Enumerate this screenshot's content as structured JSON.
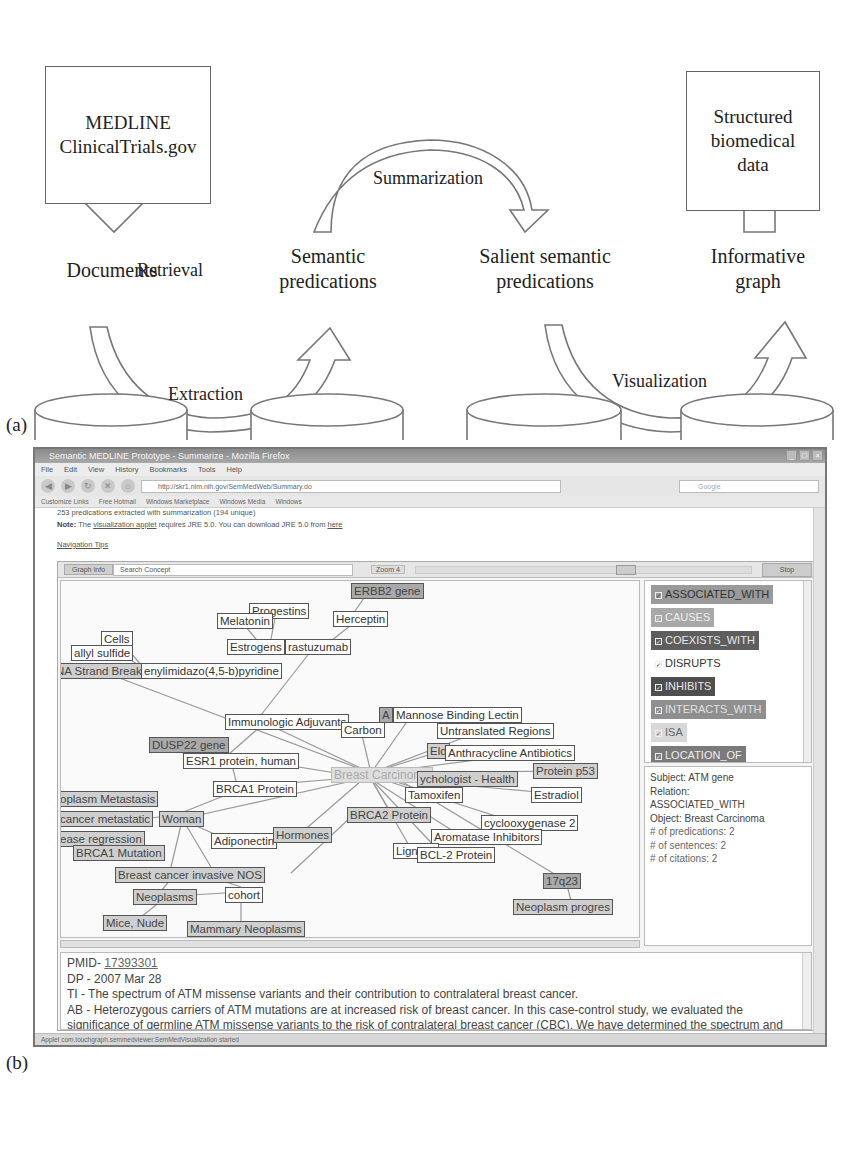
{
  "panel_a": {
    "letter": "(a)",
    "source_box": "MEDLINE\nClinicalTrials.gov",
    "output_box": "Structured\nbiomedical\ndata",
    "cylinders": [
      "Documents",
      "Semantic\npredications",
      "Salient semantic\npredications",
      "Informative\ngraph"
    ],
    "arrows": {
      "retrieval": "Retrieval",
      "extraction": "Extraction",
      "summarization": "Summarization",
      "visualization": "Visualization"
    }
  },
  "panel_b": {
    "letter": "(b)",
    "window": {
      "title": "Semantic MEDLINE Prototype - Summarize - Mozilla Firefox",
      "menu": [
        "File",
        "Edit",
        "View",
        "History",
        "Bookmarks",
        "Tools",
        "Help"
      ],
      "url": "http://skr1.nlm.nih.gov/SemMedWeb/Summary.do",
      "search_placeholder": "Google",
      "bookmarks": [
        "Customize Links",
        "Free Hotmail",
        "Windows Marketplace",
        "Windows Media",
        "Windows"
      ]
    },
    "page": {
      "predications_line": "253 predications extracted with summarization (194 unique)",
      "note_label": "Note:",
      "note_pre": "The",
      "note_link": "visualization applet",
      "note_mid": "requires JRE 5.0. You can download JRE 5.0 from",
      "note_here": "here",
      "nav_tips": "Navigation Tips"
    },
    "applet": {
      "tab_graph_info": "Graph Info",
      "search_concept": "Search Concept",
      "zoom_label": "Zoom 4",
      "stop_button": "Stop",
      "nodes": [
        {
          "label": "ERBB2 gene",
          "x": 290,
          "y": 2,
          "style": "dark"
        },
        {
          "label": "Progestins",
          "x": 188,
          "y": 22,
          "style": "plain"
        },
        {
          "label": "Melatonin",
          "x": 156,
          "y": 32,
          "style": "plain"
        },
        {
          "label": "Herceptin",
          "x": 272,
          "y": 30,
          "style": "plain"
        },
        {
          "label": "Estrogens",
          "x": 166,
          "y": 58,
          "style": "plain"
        },
        {
          "label": "rastuzumab",
          "x": 224,
          "y": 58,
          "style": "plain"
        },
        {
          "label": "Cells",
          "x": 40,
          "y": 50,
          "style": "plain"
        },
        {
          "label": "allyl sulfide",
          "x": 10,
          "y": 64,
          "style": "plain"
        },
        {
          "label": "NA Strand Break",
          "x": -8,
          "y": 82,
          "style": "mid"
        },
        {
          "label": "enylimidazo(4,5-b)pyridine",
          "x": 80,
          "y": 82,
          "style": "plain"
        },
        {
          "label": "Immunologic Adjuvants",
          "x": 164,
          "y": 133,
          "style": "plain"
        },
        {
          "label": "Carbon",
          "x": 280,
          "y": 141,
          "style": "plain"
        },
        {
          "label": "A",
          "x": 318,
          "y": 126,
          "style": "dark"
        },
        {
          "label": "Mannose Binding Lectin",
          "x": 332,
          "y": 126,
          "style": "plain"
        },
        {
          "label": "Untranslated Regions",
          "x": 376,
          "y": 142,
          "style": "plain"
        },
        {
          "label": "DUSP22 gene",
          "x": 88,
          "y": 156,
          "style": "dark"
        },
        {
          "label": "ESR1 protein, human",
          "x": 122,
          "y": 172,
          "style": "plain"
        },
        {
          "label": "Eld",
          "x": 366,
          "y": 162,
          "style": "mid"
        },
        {
          "label": "Anthracycline Antibiotics",
          "x": 384,
          "y": 164,
          "style": "plain"
        },
        {
          "label": "Breast Carcinoma",
          "x": 270,
          "y": 186,
          "style": "center"
        },
        {
          "label": "Protein p53",
          "x": 472,
          "y": 182,
          "style": "mid"
        },
        {
          "label": "ychologist - Health",
          "x": 356,
          "y": 190,
          "style": "mid"
        },
        {
          "label": "BRCA1 Protein",
          "x": 152,
          "y": 200,
          "style": "plain"
        },
        {
          "label": "oplasm Metastasis",
          "x": -4,
          "y": 210,
          "style": "mid"
        },
        {
          "label": "Tamoxifen",
          "x": 344,
          "y": 206,
          "style": "plain"
        },
        {
          "label": "Estradiol",
          "x": 470,
          "y": 206,
          "style": "plain"
        },
        {
          "label": "cancer metastatic",
          "x": -4,
          "y": 230,
          "style": "mid"
        },
        {
          "label": "Woman",
          "x": 98,
          "y": 230,
          "style": "mid"
        },
        {
          "label": "BRCA2 Protein",
          "x": 286,
          "y": 226,
          "style": "mid"
        },
        {
          "label": "cyclooxygenase 2",
          "x": 420,
          "y": 234,
          "style": "plain"
        },
        {
          "label": "ease regression",
          "x": -4,
          "y": 250,
          "style": "mid"
        },
        {
          "label": "Adiponectin",
          "x": 150,
          "y": 252,
          "style": "plain"
        },
        {
          "label": "Hormones",
          "x": 212,
          "y": 246,
          "style": "mid"
        },
        {
          "label": "Aromatase Inhibitors",
          "x": 370,
          "y": 248,
          "style": "plain"
        },
        {
          "label": "Lignans",
          "x": 332,
          "y": 262,
          "style": "plain"
        },
        {
          "label": "BCL-2 Protein",
          "x": 356,
          "y": 266,
          "style": "plain"
        },
        {
          "label": "BRCA1 Mutation",
          "x": 12,
          "y": 264,
          "style": "mid"
        },
        {
          "label": "Breast cancer invasive NOS",
          "x": 54,
          "y": 286,
          "style": "mid"
        },
        {
          "label": "17q23",
          "x": 482,
          "y": 292,
          "style": "dark"
        },
        {
          "label": "Neoplasms",
          "x": 72,
          "y": 308,
          "style": "mid"
        },
        {
          "label": "cohort",
          "x": 164,
          "y": 306,
          "style": "plain"
        },
        {
          "label": "Neoplasm progres",
          "x": 452,
          "y": 318,
          "style": "mid"
        },
        {
          "label": "Mice, Nude",
          "x": 42,
          "y": 334,
          "style": "mid"
        },
        {
          "label": "Mammary Neoplasms",
          "x": 126,
          "y": 340,
          "style": "mid"
        }
      ],
      "relations": [
        {
          "label": "ASSOCIATED_WITH",
          "bg": "#9a9a9a",
          "fg": "#333333"
        },
        {
          "label": "CAUSES",
          "bg": "#a8a8a8",
          "fg": "#eeeeee"
        },
        {
          "label": "COEXISTS_WITH",
          "bg": "#5e5e5e",
          "fg": "#e8e8e8"
        },
        {
          "label": "DISRUPTS",
          "bg": "#ffffff",
          "fg": "#333333"
        },
        {
          "label": "INHIBITS",
          "bg": "#4f4f4f",
          "fg": "#e8e8e8"
        },
        {
          "label": "INTERACTS_WITH",
          "bg": "#8f8f8f",
          "fg": "#e0e0e0"
        },
        {
          "label": "ISA",
          "bg": "#d8d8d8",
          "fg": "#666666"
        },
        {
          "label": "LOCATION_OF",
          "bg": "#7a7a7a",
          "fg": "#eeeeee"
        },
        {
          "label": "PART_OF",
          "bg": "#8e8e8e",
          "fg": "#eeeeee"
        }
      ],
      "info": {
        "subject": "Subject: ATM gene",
        "relation_label": "Relation:",
        "relation_value": "ASSOCIATED_WITH",
        "object": "Object: Breast Carcinoma",
        "predications": "# of predications: 2",
        "sentences": "# of sentences: 2",
        "citations": "# of citations: 2"
      },
      "abstract": {
        "pmid_label": "PMID- ",
        "pmid_value": "17393301",
        "dp": "DP - 2007 Mar 28",
        "ti": "TI - The spectrum of ATM missense variants and their contribution to contralateral breast cancer.",
        "ab": "AB - Heterozygous carriers of ATM mutations are at increased risk of breast cancer. In this case-control study, we evaluated the significance of germline ATM missense variants to the risk of contralateral breast cancer (CBC). We have determined the spectrum and frequency of ATM missense variants in 443 breast cancer patients diagnosed before age 50, including 247 patients who subsequently developed CBC. Twenty-one per cent of the women with"
      }
    },
    "status": "Applet com.touchgraph.semmedviewer.SemMedVisualization started"
  }
}
